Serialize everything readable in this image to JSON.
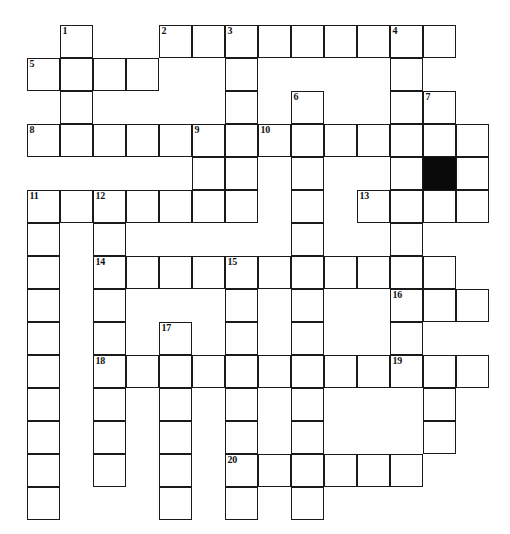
{
  "puzzle": {
    "title": "Crossword Puzzle Grid",
    "columns": 14,
    "rows": 15,
    "cell_size_px": 33,
    "origin_x_px": 27,
    "origin_y_px": 25,
    "colors": {
      "background": "#ffffff",
      "cell_fill": "#ffffff",
      "grid_line": "#1a1a1a",
      "block_fill": "#0a0a0a",
      "number_text": "#111111"
    },
    "numbers_visible": [
      "1",
      "2",
      "3",
      "4",
      "5",
      "6",
      "7",
      "8",
      "9",
      "10",
      "11",
      "12",
      "13",
      "14",
      "15",
      "16",
      "17",
      "18",
      "19",
      "20"
    ],
    "block_cells": [
      {
        "row": 4,
        "col": 12
      }
    ],
    "cells": [
      {
        "row": 0,
        "col": 1,
        "num": "1"
      },
      {
        "row": 0,
        "col": 4,
        "num": "2"
      },
      {
        "row": 0,
        "col": 5,
        "num": ""
      },
      {
        "row": 0,
        "col": 6,
        "num": "3"
      },
      {
        "row": 0,
        "col": 7,
        "num": ""
      },
      {
        "row": 0,
        "col": 8,
        "num": ""
      },
      {
        "row": 0,
        "col": 9,
        "num": ""
      },
      {
        "row": 0,
        "col": 10,
        "num": ""
      },
      {
        "row": 0,
        "col": 11,
        "num": "4"
      },
      {
        "row": 0,
        "col": 12,
        "num": ""
      },
      {
        "row": 1,
        "col": 0,
        "num": "5"
      },
      {
        "row": 1,
        "col": 1,
        "num": ""
      },
      {
        "row": 1,
        "col": 2,
        "num": ""
      },
      {
        "row": 1,
        "col": 3,
        "num": ""
      },
      {
        "row": 1,
        "col": 6,
        "num": ""
      },
      {
        "row": 1,
        "col": 11,
        "num": ""
      },
      {
        "row": 2,
        "col": 1,
        "num": ""
      },
      {
        "row": 2,
        "col": 6,
        "num": ""
      },
      {
        "row": 2,
        "col": 8,
        "num": "6"
      },
      {
        "row": 2,
        "col": 11,
        "num": ""
      },
      {
        "row": 2,
        "col": 12,
        "num": "7"
      },
      {
        "row": 3,
        "col": 0,
        "num": "8"
      },
      {
        "row": 3,
        "col": 1,
        "num": ""
      },
      {
        "row": 3,
        "col": 2,
        "num": ""
      },
      {
        "row": 3,
        "col": 3,
        "num": ""
      },
      {
        "row": 3,
        "col": 4,
        "num": ""
      },
      {
        "row": 3,
        "col": 5,
        "num": "9"
      },
      {
        "row": 3,
        "col": 6,
        "num": ""
      },
      {
        "row": 3,
        "col": 7,
        "num": "10"
      },
      {
        "row": 3,
        "col": 8,
        "num": ""
      },
      {
        "row": 3,
        "col": 9,
        "num": ""
      },
      {
        "row": 3,
        "col": 10,
        "num": ""
      },
      {
        "row": 3,
        "col": 11,
        "num": ""
      },
      {
        "row": 3,
        "col": 12,
        "num": ""
      },
      {
        "row": 3,
        "col": 13,
        "num": ""
      },
      {
        "row": 4,
        "col": 5,
        "num": ""
      },
      {
        "row": 4,
        "col": 6,
        "num": ""
      },
      {
        "row": 4,
        "col": 8,
        "num": ""
      },
      {
        "row": 4,
        "col": 11,
        "num": ""
      },
      {
        "row": 4,
        "col": 12,
        "num": ""
      },
      {
        "row": 4,
        "col": 13,
        "num": ""
      },
      {
        "row": 5,
        "col": 0,
        "num": "11"
      },
      {
        "row": 5,
        "col": 1,
        "num": ""
      },
      {
        "row": 5,
        "col": 2,
        "num": "12"
      },
      {
        "row": 5,
        "col": 3,
        "num": ""
      },
      {
        "row": 5,
        "col": 4,
        "num": ""
      },
      {
        "row": 5,
        "col": 5,
        "num": ""
      },
      {
        "row": 5,
        "col": 6,
        "num": ""
      },
      {
        "row": 5,
        "col": 8,
        "num": ""
      },
      {
        "row": 5,
        "col": 10,
        "num": "13"
      },
      {
        "row": 5,
        "col": 11,
        "num": ""
      },
      {
        "row": 5,
        "col": 12,
        "num": ""
      },
      {
        "row": 5,
        "col": 13,
        "num": ""
      },
      {
        "row": 6,
        "col": 0,
        "num": ""
      },
      {
        "row": 6,
        "col": 2,
        "num": ""
      },
      {
        "row": 6,
        "col": 8,
        "num": ""
      },
      {
        "row": 6,
        "col": 11,
        "num": ""
      },
      {
        "row": 7,
        "col": 0,
        "num": ""
      },
      {
        "row": 7,
        "col": 2,
        "num": "14"
      },
      {
        "row": 7,
        "col": 3,
        "num": ""
      },
      {
        "row": 7,
        "col": 4,
        "num": ""
      },
      {
        "row": 7,
        "col": 5,
        "num": ""
      },
      {
        "row": 7,
        "col": 6,
        "num": "15"
      },
      {
        "row": 7,
        "col": 7,
        "num": ""
      },
      {
        "row": 7,
        "col": 8,
        "num": ""
      },
      {
        "row": 7,
        "col": 9,
        "num": ""
      },
      {
        "row": 7,
        "col": 10,
        "num": ""
      },
      {
        "row": 7,
        "col": 11,
        "num": ""
      },
      {
        "row": 7,
        "col": 12,
        "num": ""
      },
      {
        "row": 8,
        "col": 0,
        "num": ""
      },
      {
        "row": 8,
        "col": 2,
        "num": ""
      },
      {
        "row": 8,
        "col": 6,
        "num": ""
      },
      {
        "row": 8,
        "col": 8,
        "num": ""
      },
      {
        "row": 8,
        "col": 11,
        "num": "16"
      },
      {
        "row": 8,
        "col": 12,
        "num": ""
      },
      {
        "row": 8,
        "col": 13,
        "num": ""
      },
      {
        "row": 9,
        "col": 0,
        "num": ""
      },
      {
        "row": 9,
        "col": 2,
        "num": ""
      },
      {
        "row": 9,
        "col": 4,
        "num": "17"
      },
      {
        "row": 9,
        "col": 6,
        "num": ""
      },
      {
        "row": 9,
        "col": 8,
        "num": ""
      },
      {
        "row": 9,
        "col": 11,
        "num": ""
      },
      {
        "row": 10,
        "col": 0,
        "num": ""
      },
      {
        "row": 10,
        "col": 2,
        "num": "18"
      },
      {
        "row": 10,
        "col": 3,
        "num": ""
      },
      {
        "row": 10,
        "col": 4,
        "num": ""
      },
      {
        "row": 10,
        "col": 5,
        "num": ""
      },
      {
        "row": 10,
        "col": 6,
        "num": ""
      },
      {
        "row": 10,
        "col": 7,
        "num": ""
      },
      {
        "row": 10,
        "col": 8,
        "num": ""
      },
      {
        "row": 10,
        "col": 9,
        "num": ""
      },
      {
        "row": 10,
        "col": 10,
        "num": ""
      },
      {
        "row": 10,
        "col": 11,
        "num": "19"
      },
      {
        "row": 10,
        "col": 12,
        "num": ""
      },
      {
        "row": 10,
        "col": 13,
        "num": ""
      },
      {
        "row": 11,
        "col": 0,
        "num": ""
      },
      {
        "row": 11,
        "col": 2,
        "num": ""
      },
      {
        "row": 11,
        "col": 4,
        "num": ""
      },
      {
        "row": 11,
        "col": 6,
        "num": ""
      },
      {
        "row": 11,
        "col": 8,
        "num": ""
      },
      {
        "row": 11,
        "col": 12,
        "num": ""
      },
      {
        "row": 12,
        "col": 0,
        "num": ""
      },
      {
        "row": 12,
        "col": 2,
        "num": ""
      },
      {
        "row": 12,
        "col": 4,
        "num": ""
      },
      {
        "row": 12,
        "col": 6,
        "num": ""
      },
      {
        "row": 12,
        "col": 8,
        "num": ""
      },
      {
        "row": 12,
        "col": 12,
        "num": ""
      },
      {
        "row": 13,
        "col": 0,
        "num": ""
      },
      {
        "row": 13,
        "col": 2,
        "num": ""
      },
      {
        "row": 13,
        "col": 4,
        "num": ""
      },
      {
        "row": 13,
        "col": 6,
        "num": "20"
      },
      {
        "row": 13,
        "col": 7,
        "num": ""
      },
      {
        "row": 13,
        "col": 8,
        "num": ""
      },
      {
        "row": 13,
        "col": 9,
        "num": ""
      },
      {
        "row": 13,
        "col": 10,
        "num": ""
      },
      {
        "row": 13,
        "col": 11,
        "num": ""
      },
      {
        "row": 14,
        "col": 0,
        "num": ""
      },
      {
        "row": 14,
        "col": 4,
        "num": ""
      },
      {
        "row": 14,
        "col": 6,
        "num": ""
      },
      {
        "row": 14,
        "col": 8,
        "num": ""
      }
    ]
  }
}
